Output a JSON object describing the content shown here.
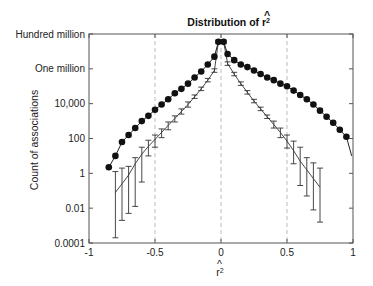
{
  "chart_data": {
    "type": "line",
    "title_base": "Distribution of ",
    "title_symbol": "r",
    "xlabel": "r̂²",
    "xlabel_symbol": "r",
    "ylabel": "Count of associations",
    "yscale": "log",
    "xlim": [
      -1,
      1
    ],
    "ylim_log10": [
      -4,
      8
    ],
    "x_ticks": [
      {
        "value": -1,
        "label": "-1"
      },
      {
        "value": -0.5,
        "label": "-0.5"
      },
      {
        "value": 0,
        "label": "0"
      },
      {
        "value": 0.5,
        "label": "0.5"
      },
      {
        "value": 1,
        "label": "1"
      }
    ],
    "y_ticks": [
      {
        "log10": 8,
        "label": "Hundred million"
      },
      {
        "log10": 6,
        "label": "One million"
      },
      {
        "log10": 4,
        "label": "10,000"
      },
      {
        "log10": 2,
        "label": "100"
      },
      {
        "log10": 0,
        "label": "1"
      },
      {
        "log10": -2,
        "label": "0.01"
      },
      {
        "log10": -4,
        "label": "0.0001"
      }
    ],
    "grid": {
      "vertical_dashed_at": [
        -0.5,
        0,
        0.5
      ]
    },
    "series": [
      {
        "name": "Observed",
        "marker": "filled-circle",
        "x": [
          -0.85,
          -0.8,
          -0.75,
          -0.7,
          -0.65,
          -0.6,
          -0.55,
          -0.5,
          -0.45,
          -0.4,
          -0.35,
          -0.3,
          -0.25,
          -0.2,
          -0.15,
          -0.1,
          -0.05,
          -0.02,
          0.02,
          0.05,
          0.1,
          0.15,
          0.2,
          0.25,
          0.3,
          0.35,
          0.4,
          0.45,
          0.5,
          0.55,
          0.6,
          0.65,
          0.7,
          0.75,
          0.8,
          0.85,
          0.9,
          0.95
        ],
        "log10_values": [
          0.35,
          1.0,
          1.8,
          2.2,
          2.6,
          3.0,
          3.3,
          3.65,
          3.95,
          4.25,
          4.6,
          4.85,
          5.15,
          5.5,
          5.85,
          6.25,
          6.7,
          7.55,
          7.55,
          6.85,
          6.5,
          6.25,
          6.1,
          5.9,
          5.7,
          5.5,
          5.35,
          5.15,
          5.0,
          4.75,
          4.5,
          4.25,
          3.95,
          3.6,
          3.25,
          2.9,
          2.5,
          2.1
        ],
        "line_end": {
          "x": 0.99,
          "log10": 1.0
        }
      },
      {
        "name": "Expected (with error bars)",
        "marker": "error-bar",
        "x": [
          -0.8,
          -0.75,
          -0.7,
          -0.65,
          -0.6,
          -0.55,
          -0.5,
          -0.45,
          -0.4,
          -0.35,
          -0.3,
          -0.25,
          -0.2,
          -0.15,
          -0.1,
          -0.05,
          -0.02,
          0.02,
          0.05,
          0.1,
          0.15,
          0.2,
          0.25,
          0.3,
          0.35,
          0.4,
          0.45,
          0.5,
          0.55,
          0.6,
          0.65,
          0.7,
          0.75
        ],
        "log10_values": [
          -1.1,
          -0.6,
          -0.1,
          0.55,
          1.1,
          1.55,
          1.95,
          2.35,
          2.75,
          3.15,
          3.55,
          3.95,
          4.4,
          4.85,
          5.35,
          5.9,
          7.55,
          7.55,
          6.3,
          5.7,
          5.15,
          4.65,
          4.15,
          3.7,
          3.25,
          2.8,
          2.35,
          1.85,
          1.3,
          0.7,
          0.2,
          -0.3,
          -0.8
        ],
        "err_low": [
          -3.7,
          -2.7,
          -2.3,
          -1.9,
          -0.5,
          1.0,
          1.5,
          2.05,
          2.5,
          2.95,
          3.4,
          3.8,
          4.3,
          4.75,
          5.25,
          5.8,
          7.45,
          7.45,
          6.2,
          5.6,
          5.05,
          4.55,
          4.05,
          3.6,
          3.15,
          2.6,
          2.05,
          1.45,
          0.55,
          -0.7,
          -1.3,
          -2.1,
          -2.8
        ],
        "err_high": [
          0.1,
          0.3,
          0.4,
          0.9,
          1.5,
          1.9,
          2.2,
          2.55,
          2.95,
          3.3,
          3.7,
          4.1,
          4.5,
          4.95,
          5.45,
          6.0,
          7.65,
          7.65,
          6.4,
          5.8,
          5.25,
          4.75,
          4.25,
          3.8,
          3.35,
          3.0,
          2.6,
          2.2,
          1.85,
          1.5,
          0.9,
          0.6,
          0.3
        ]
      }
    ]
  }
}
